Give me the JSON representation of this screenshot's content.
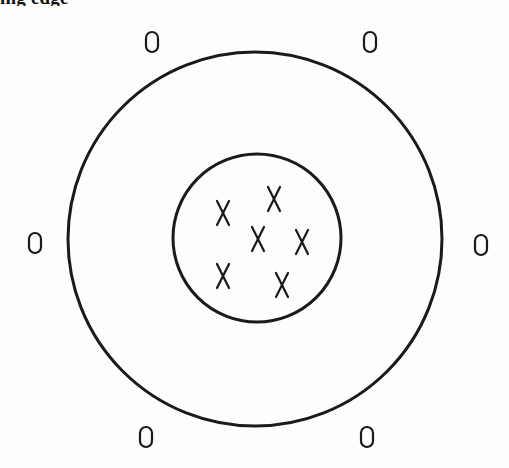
{
  "page": {
    "clipped_heading": "ing edge"
  },
  "diagram": {
    "type": "concentric-circles-scatter",
    "stroke_color": "#1a1a1a",
    "outer_circle": {
      "cx": 255,
      "cy": 239,
      "r": 187,
      "stroke_width": 3
    },
    "inner_circle": {
      "cx": 257,
      "cy": 238,
      "r": 84,
      "stroke_width": 3
    },
    "inner_marks": {
      "symbol": "X",
      "count": 6,
      "points": [
        {
          "x": 223,
          "y": 213
        },
        {
          "x": 274,
          "y": 199
        },
        {
          "x": 258,
          "y": 239
        },
        {
          "x": 302,
          "y": 242
        },
        {
          "x": 223,
          "y": 276
        },
        {
          "x": 282,
          "y": 285
        }
      ]
    },
    "outer_marks": {
      "symbol": "O",
      "count": 6,
      "points": [
        {
          "x": 152,
          "y": 42
        },
        {
          "x": 370,
          "y": 42
        },
        {
          "x": 35,
          "y": 243
        },
        {
          "x": 481,
          "y": 245
        },
        {
          "x": 146,
          "y": 437
        },
        {
          "x": 367,
          "y": 437
        }
      ]
    }
  }
}
